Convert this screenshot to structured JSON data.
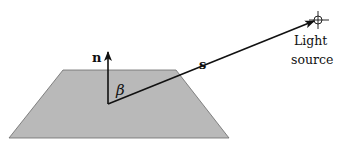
{
  "diagram": {
    "surface": {
      "fill": "#b9b9b9",
      "stroke": "#555555"
    },
    "labels": {
      "normal": "n",
      "angle": "β",
      "light_vector": "s",
      "light_source_line1": "Light",
      "light_source_line2": "source"
    },
    "colors": {
      "ink": "#111111"
    }
  }
}
